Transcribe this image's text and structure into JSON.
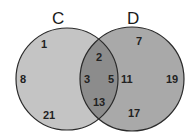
{
  "diagram": {
    "type": "venn",
    "sets": [
      {
        "label": "C",
        "only": [
          "1",
          "8",
          "21"
        ]
      },
      {
        "label": "D",
        "only": [
          "7",
          "11",
          "19",
          "17"
        ]
      }
    ],
    "intersection": [
      "2",
      "3",
      "5",
      "13"
    ],
    "colors": {
      "c_fill": "#c4c4c4",
      "d_fill": "#a9a9a9",
      "overlap_fill": "#8c8c8c",
      "stroke": "#2a2a2a"
    }
  },
  "labels": {
    "c": "C",
    "d": "D"
  },
  "numbers": {
    "c1": "1",
    "c8": "8",
    "c21": "21",
    "i2": "2",
    "i3": "3",
    "i5": "5",
    "i13": "13",
    "d7": "7",
    "d11": "11",
    "d19": "19",
    "d17": "17"
  }
}
